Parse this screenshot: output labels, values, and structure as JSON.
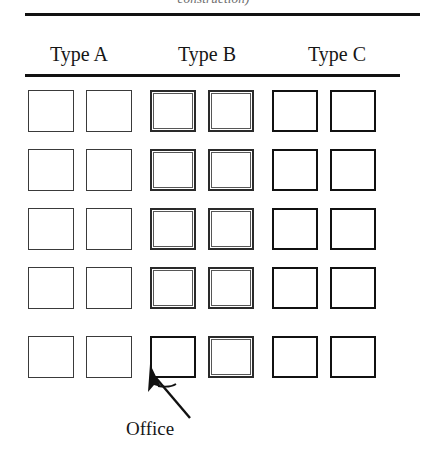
{
  "figure": {
    "caption_clipped": "construction)",
    "column_headers": [
      {
        "label": "Type A"
      },
      {
        "label": "Type B"
      },
      {
        "label": "Type C"
      }
    ],
    "annotation": {
      "label": "Office",
      "target_row": 5,
      "target_column": 3
    },
    "grid": {
      "rows": 5,
      "columns": 6,
      "column_types": [
        "A",
        "A",
        "B",
        "B",
        "C",
        "C"
      ],
      "cells": [
        [
          "A",
          "A",
          "B",
          "B",
          "C",
          "C"
        ],
        [
          "A",
          "A",
          "B",
          "B",
          "C",
          "C"
        ],
        [
          "A",
          "A",
          "B",
          "B",
          "C",
          "C"
        ],
        [
          "A",
          "A",
          "B",
          "B",
          "C",
          "C"
        ],
        [
          "A",
          "A",
          "C",
          "B",
          "C",
          "C"
        ]
      ]
    },
    "colors": {
      "background": "#ffffff",
      "ink": "#111111",
      "light_ink": "#3a3a3a",
      "inner_line": "#565656"
    }
  }
}
